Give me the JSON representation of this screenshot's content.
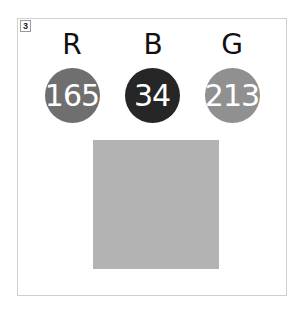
{
  "figure": {
    "number": "3",
    "channels": [
      {
        "letter": "R",
        "value": "165",
        "circle_color": "#6f6f6f",
        "center_x": 72
      },
      {
        "letter": "B",
        "value": "34",
        "circle_color": "#262626",
        "center_x": 152
      },
      {
        "letter": "G",
        "value": "213",
        "circle_color": "#909090",
        "center_x": 232
      }
    ],
    "swatch": {
      "color": "#b3b3b3"
    }
  }
}
